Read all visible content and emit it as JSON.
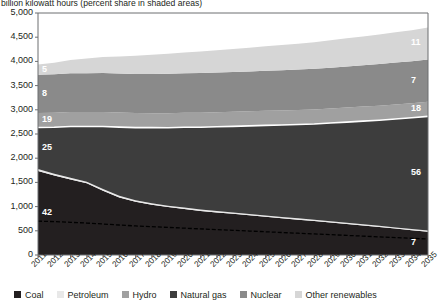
{
  "subtitle": "billion kilowatt hours (percent share in shaded areas)",
  "legend": {
    "items": [
      {
        "label": "Coal",
        "color": "#231f20"
      },
      {
        "label": "Petroleum",
        "color": "#e8e8e8"
      },
      {
        "label": "Hydro",
        "color": "#a0a0a0"
      },
      {
        "label": "Natural gas",
        "color": "#3d3d3d"
      },
      {
        "label": "Nuclear",
        "color": "#8a8a8a"
      },
      {
        "label": "Other renewables",
        "color": "#d6d6d6"
      }
    ]
  },
  "axes": {
    "y_ticks": [
      "5,000",
      "4,500",
      "4,000",
      "3,500",
      "3,000",
      "2,500",
      "2,000",
      "1,500",
      "1,000",
      "500",
      "0"
    ],
    "x_ticks": [
      "2011",
      "2012",
      "2013",
      "2014",
      "2015",
      "2016",
      "2017",
      "2018",
      "2019",
      "2020",
      "2021",
      "2022",
      "2023",
      "2024",
      "2025",
      "2026",
      "2027",
      "2028",
      "2029",
      "2030",
      "2031",
      "2032",
      "2033",
      "2034",
      "2035"
    ]
  },
  "share_labels": {
    "left": [
      {
        "value": "42",
        "series": "Coal"
      },
      {
        "value": "25",
        "series": "Natural gas"
      },
      {
        "value": "19",
        "series": "Hydro"
      },
      {
        "value": "8",
        "series": "Nuclear"
      },
      {
        "value": "5",
        "series": "Other renewables"
      }
    ],
    "right": [
      {
        "value": "7",
        "series": "Coal"
      },
      {
        "value": "56",
        "series": "Natural gas"
      },
      {
        "value": "18",
        "series": "Hydro"
      },
      {
        "value": "7",
        "series": "Nuclear"
      },
      {
        "value": "11",
        "series": "Other renewables"
      }
    ]
  },
  "chart_data": {
    "type": "area",
    "title": "",
    "subtitle": "billion kilowatt hours (percent share in shaded areas)",
    "xlabel": "",
    "ylabel": "billion kilowatt hours",
    "ylim": [
      0,
      5000
    ],
    "ytick_step": 500,
    "grid": false,
    "legend_position": "bottom",
    "stacked": true,
    "x": [
      2011,
      2012,
      2013,
      2014,
      2015,
      2016,
      2017,
      2018,
      2019,
      2020,
      2021,
      2022,
      2023,
      2024,
      2025,
      2026,
      2027,
      2028,
      2029,
      2030,
      2031,
      2032,
      2033,
      2034,
      2035
    ],
    "series": [
      {
        "name": "Coal",
        "color": "#231f20",
        "start_share_pct": 42,
        "end_share_pct": 7,
        "values": [
          1735,
          1640,
          1560,
          1480,
          1330,
          1190,
          1100,
          1040,
          990,
          950,
          910,
          880,
          850,
          820,
          790,
          760,
          730,
          700,
          670,
          640,
          610,
          580,
          545,
          510,
          480
        ]
      },
      {
        "name": "Petroleum",
        "color": "#e8e8e8",
        "values": [
          40,
          38,
          36,
          35,
          34,
          33,
          32,
          31,
          30,
          30,
          29,
          29,
          28,
          28,
          28,
          27,
          27,
          27,
          26,
          26,
          26,
          25,
          25,
          25,
          25
        ]
      },
      {
        "name": "Natural gas",
        "color": "#3d3d3d",
        "start_share_pct": 25,
        "end_share_pct": 56,
        "values": [
          860,
          960,
          1060,
          1140,
          1290,
          1420,
          1500,
          1560,
          1610,
          1660,
          1700,
          1740,
          1780,
          1820,
          1860,
          1900,
          1940,
          1980,
          2030,
          2080,
          2130,
          2180,
          2240,
          2300,
          2360
        ]
      },
      {
        "name": "Hydro",
        "color": "#a0a0a0",
        "start_share_pct": 19,
        "end_share_pct": 18,
        "values": [
          300,
          300,
          300,
          300,
          300,
          300,
          300,
          300,
          300,
          300,
          300,
          300,
          300,
          300,
          300,
          300,
          300,
          300,
          300,
          300,
          300,
          300,
          300,
          300,
          300
        ]
      },
      {
        "name": "Nuclear",
        "color": "#8a8a8a",
        "start_share_pct": 8,
        "end_share_pct": 7,
        "values": [
          790,
          795,
          800,
          800,
          805,
          805,
          810,
          810,
          815,
          815,
          820,
          820,
          825,
          825,
          830,
          830,
          835,
          840,
          845,
          850,
          855,
          860,
          865,
          870,
          875
        ]
      },
      {
        "name": "Other renewables",
        "color": "#d6d6d6",
        "start_share_pct": 5,
        "end_share_pct": 11,
        "values": [
          210,
          240,
          275,
          305,
          330,
          355,
          375,
          395,
          415,
          430,
          445,
          460,
          475,
          490,
          505,
          520,
          535,
          550,
          565,
          580,
          595,
          610,
          625,
          640,
          660
        ]
      }
    ],
    "annotation_line": {
      "name": "coal-reference-line",
      "style": "dashed",
      "color": "#000000",
      "values": [
        700,
        690,
        675,
        660,
        640,
        620,
        600,
        585,
        570,
        555,
        540,
        525,
        510,
        495,
        480,
        465,
        450,
        435,
        420,
        405,
        390,
        375,
        360,
        345,
        330
      ]
    }
  }
}
